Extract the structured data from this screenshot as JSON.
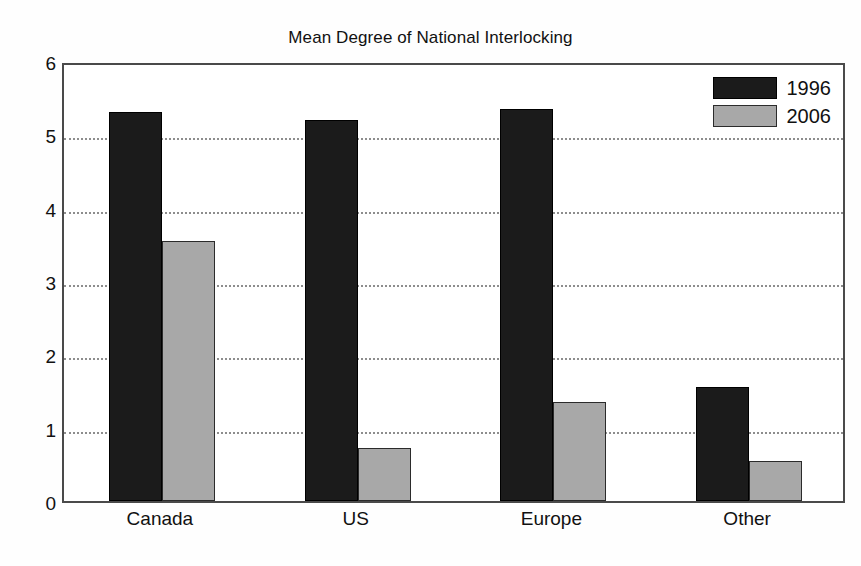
{
  "chart_data": {
    "type": "bar",
    "title": "Mean Degree of National Interlocking",
    "xlabel": "",
    "ylabel": "",
    "categories": [
      "Canada",
      "US",
      "Europe",
      "Other"
    ],
    "series": [
      {
        "name": "1996",
        "color": "#1b1b1b",
        "values": [
          5.3,
          5.2,
          5.35,
          1.55
        ]
      },
      {
        "name": "2006",
        "color": "#a8a8a8",
        "values": [
          3.55,
          0.72,
          1.35,
          0.55
        ]
      }
    ],
    "ylim": [
      0,
      6
    ],
    "y_ticks": [
      0,
      1,
      2,
      3,
      4,
      5,
      6
    ],
    "y_tick_labels": [
      "0",
      "1",
      "2",
      "3",
      "4",
      "5",
      "6"
    ],
    "grid": true,
    "grid_style": "dotted",
    "legend_position": "upper-right",
    "frame": true,
    "background": "#ffffff"
  },
  "legend": {
    "entries": [
      {
        "label": "1996"
      },
      {
        "label": "2006"
      }
    ]
  }
}
